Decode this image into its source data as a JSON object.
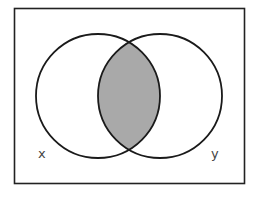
{
  "diagram": {
    "type": "venn",
    "universe": {
      "x": 14,
      "y": 8,
      "width": 231,
      "height": 176,
      "stroke": "#222222"
    },
    "sets": [
      {
        "id": "x",
        "label": "X",
        "display_label": "x",
        "cx": 98,
        "cy": 96,
        "r": 62
      },
      {
        "id": "y",
        "label": "Y",
        "display_label": "y",
        "cx": 160,
        "cy": 96,
        "r": 62
      }
    ],
    "shaded_region": "x ∩ y",
    "colors": {
      "stroke": "#1a1a1a",
      "shade": "#a9a9a9",
      "background": "#ffffff"
    }
  }
}
